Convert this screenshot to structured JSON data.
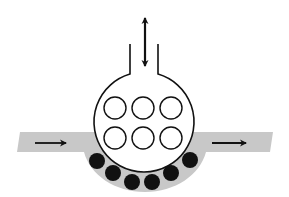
{
  "diagram": {
    "colors": {
      "background": "#ffffff",
      "channel": "#c8c8c8",
      "stroke": "#111111",
      "hollow_fill": "#ffffff",
      "solid_fill": "#111111"
    },
    "vessel": {
      "center": [
        145,
        122
      ],
      "radius": 50,
      "neck": {
        "left_x": 130,
        "right_x": 158,
        "top_y": 44
      }
    },
    "vertical_arrow": {
      "x": 145,
      "y1": 16,
      "y2": 68,
      "direction": "bidirectional"
    },
    "hollow_circles": [
      {
        "cx": 115,
        "cy": 108,
        "r": 11
      },
      {
        "cx": 143,
        "cy": 108,
        "r": 11
      },
      {
        "cx": 171,
        "cy": 108,
        "r": 11
      },
      {
        "cx": 115,
        "cy": 138,
        "r": 11
      },
      {
        "cx": 143,
        "cy": 138,
        "r": 11
      },
      {
        "cx": 171,
        "cy": 138,
        "r": 11
      }
    ],
    "solid_circles": [
      {
        "cx": 97,
        "cy": 161,
        "r": 8
      },
      {
        "cx": 113,
        "cy": 173,
        "r": 8
      },
      {
        "cx": 132,
        "cy": 182,
        "r": 8
      },
      {
        "cx": 152,
        "cy": 182,
        "r": 8
      },
      {
        "cx": 171,
        "cy": 173,
        "r": 8
      },
      {
        "cx": 190,
        "cy": 160,
        "r": 8
      }
    ],
    "flow_arrows": [
      {
        "name": "inflow",
        "x1": 35,
        "x2": 67,
        "y": 143
      },
      {
        "name": "outflow",
        "x1": 212,
        "x2": 247,
        "y": 143
      }
    ]
  }
}
